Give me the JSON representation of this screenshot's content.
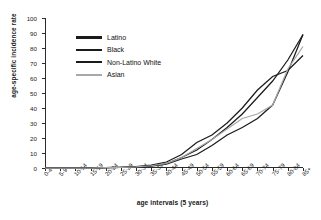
{
  "chart_data": {
    "type": "line",
    "title": "",
    "xlabel": "age intervals (5 years)",
    "ylabel": "age-specific incidence rate",
    "categories": [
      "0-4",
      "5-9",
      "10-14",
      "15-19",
      "20-24",
      "25-29",
      "30-34",
      "35-39",
      "40-44",
      "45-49",
      "50-54",
      "55-59",
      "60-64",
      "65-69",
      "70-74",
      "75-79",
      "80-84",
      "85+"
    ],
    "ylim": [
      0,
      100
    ],
    "yticks": [
      0,
      10,
      20,
      30,
      40,
      50,
      60,
      70,
      80,
      90,
      100
    ],
    "grid": false,
    "legend_position": "upper-left-inside",
    "series": [
      {
        "name": "Latino",
        "color": "#1b1b1b",
        "values": [
          0,
          0,
          0,
          0,
          0.2,
          0.4,
          0.8,
          1.5,
          3,
          7,
          12,
          19,
          27,
          36,
          47,
          58,
          72,
          89
        ]
      },
      {
        "name": "Black",
        "color": "#1b1b1b",
        "values": [
          0,
          0,
          0,
          0,
          0.3,
          0.5,
          1.0,
          2.0,
          4,
          9,
          17,
          22,
          30,
          40,
          52,
          61,
          65,
          75
        ]
      },
      {
        "name": "Non-Latino White",
        "color": "#1b1b1b",
        "values": [
          0,
          0,
          0,
          0,
          0.2,
          0.4,
          0.7,
          1.2,
          2.5,
          6,
          9,
          15,
          22,
          27,
          33,
          42,
          64,
          89
        ]
      },
      {
        "name": "Asian",
        "color": "#a8a8a8",
        "values": [
          0,
          0,
          0,
          0,
          0.2,
          0.4,
          0.8,
          1.5,
          3,
          7,
          13,
          19,
          26,
          33,
          36,
          42,
          66,
          81
        ]
      }
    ]
  },
  "legend": {
    "items": [
      {
        "label": "Latino",
        "color": "#1b1b1b"
      },
      {
        "label": "Black",
        "color": "#1b1b1b"
      },
      {
        "label": "Non-Latino White",
        "color": "#1b1b1b"
      },
      {
        "label": "Asian",
        "color": "#a8a8a8"
      }
    ]
  }
}
